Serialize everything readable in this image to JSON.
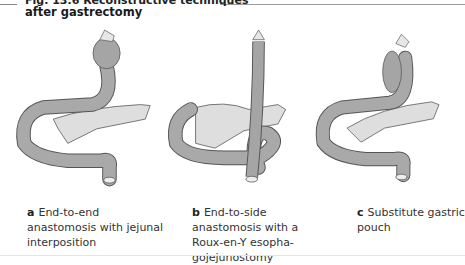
{
  "figure": {
    "title_line1": "Fig. 13.6 Reconstructive techniques",
    "title_line2": "after gastrectomy",
    "panels": [
      {
        "letter": "a",
        "caption": "End-to-end anastomosis with jejunal interposition"
      },
      {
        "letter": "b",
        "caption": "End-to-side anastomosis with a Roux-en-Y esopha-gojejunostomy"
      },
      {
        "letter": "c",
        "caption": "Substitute gastric pouch"
      }
    ],
    "colors": {
      "bowel": "#9a9a9a",
      "pancreas": "#dcdcdc",
      "outline": "#555555"
    }
  }
}
